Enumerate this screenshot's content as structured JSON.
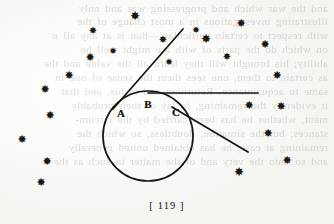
{
  "page": {
    "folio": "[ 119 ]",
    "paper_color": "#fbfbfa",
    "ink_color": "#17140f",
    "showthrough_color": "#4a463f"
  },
  "diagram": {
    "caption": "circle-with-tangents",
    "circle": {
      "cx": 148,
      "cy": 136,
      "r": 45
    },
    "points": [
      {
        "id": "A",
        "label": "A",
        "x": 121,
        "y": 113
      },
      {
        "id": "B",
        "label": "B",
        "x": 148,
        "y": 104
      },
      {
        "id": "C",
        "label": "C",
        "x": 176,
        "y": 112
      }
    ],
    "lines": [
      {
        "id": "upper-left-tangent",
        "x1": 183,
        "y1": 29,
        "x2": 113,
        "y2": 109
      },
      {
        "id": "horizontal-tangent",
        "x1": 148,
        "y1": 93,
        "x2": 258,
        "y2": 93
      },
      {
        "id": "lower-right-tangent",
        "x1": 172,
        "y1": 107,
        "x2": 248,
        "y2": 152
      }
    ],
    "stroke_width": 1.7,
    "stroke_color": "#17140f"
  },
  "specks": [
    {
      "x": 135,
      "y": 16,
      "size": 12
    },
    {
      "x": 93,
      "y": 31,
      "size": 10
    },
    {
      "x": 163,
      "y": 40,
      "size": 10
    },
    {
      "x": 206,
      "y": 39,
      "size": 12
    },
    {
      "x": 241,
      "y": 23,
      "size": 11
    },
    {
      "x": 265,
      "y": 44,
      "size": 11
    },
    {
      "x": 90,
      "y": 57,
      "size": 11
    },
    {
      "x": 227,
      "y": 57,
      "size": 10
    },
    {
      "x": 69,
      "y": 75,
      "size": 11
    },
    {
      "x": 169,
      "y": 62,
      "size": 9
    },
    {
      "x": 277,
      "y": 75,
      "size": 11
    },
    {
      "x": 45,
      "y": 89,
      "size": 11
    },
    {
      "x": 249,
      "y": 105,
      "size": 11
    },
    {
      "x": 281,
      "y": 106,
      "size": 11
    },
    {
      "x": 50,
      "y": 115,
      "size": 11
    },
    {
      "x": 268,
      "y": 133,
      "size": 11
    },
    {
      "x": 22,
      "y": 139,
      "size": 11
    },
    {
      "x": 287,
      "y": 160,
      "size": 11
    },
    {
      "x": 47,
      "y": 161,
      "size": 11
    },
    {
      "x": 239,
      "y": 172,
      "size": 12
    },
    {
      "x": 41,
      "y": 182,
      "size": 11
    },
    {
      "x": 113,
      "y": 51,
      "size": 9
    },
    {
      "x": 196,
      "y": 30,
      "size": 9
    }
  ],
  "showthrough_lines": [
    {
      "y": 2,
      "text": "and the war which and progressing was and only"
    },
    {
      "y": 15,
      "text": "illustrating investigations in a most change of the"
    },
    {
      "y": 29,
      "text": "with respect to certain particulars—that is at any all o"
    },
    {
      "y": 43,
      "text": "on which do the parts of with are might well be"
    },
    {
      "y": 57,
      "text": "ability; his brought will they learn all the value and the"
    },
    {
      "y": 71,
      "text": "as certain to them, one sees them the sense of one in"
    },
    {
      "y": 85,
      "text": "same to acquaintance.  Returning and to his, and that"
    },
    {
      "y": 99,
      "text": "it evidently the remaining, to lay of their probably"
    },
    {
      "y": 113,
      "text": "ment, whether he has been carried by the circum-"
    },
    {
      "y": 127,
      "text": "stances; but the situation, doubtless, so which the"
    },
    {
      "y": 141,
      "text": "remaining at case, he has obtained united generally"
    },
    {
      "y": 155,
      "text": "and so unto the very and of the matter in such as the"
    }
  ]
}
